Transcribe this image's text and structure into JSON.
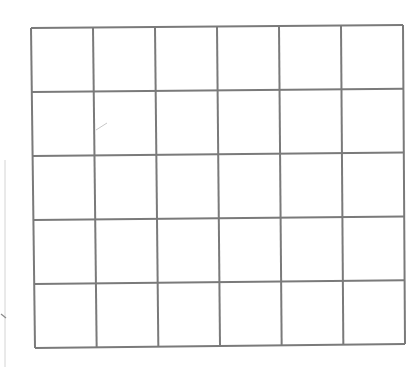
{
  "diagram": {
    "type": "empty-grid",
    "columns": 6,
    "rows": 5,
    "cells": [
      [
        "",
        "",
        "",
        "",
        "",
        ""
      ],
      [
        "",
        "",
        "",
        "",
        "",
        ""
      ],
      [
        "",
        "",
        "",
        "",
        "",
        ""
      ],
      [
        "",
        "",
        "",
        "",
        "",
        ""
      ],
      [
        "",
        "",
        "",
        "",
        "",
        ""
      ]
    ],
    "corners": {
      "top_left": [
        31,
        28
      ],
      "top_right": [
        403,
        25
      ],
      "bottom_right": [
        405,
        344
      ],
      "bottom_left": [
        35,
        348
      ]
    },
    "line_color": "#7a7a7a",
    "background_color": "#ffffff"
  }
}
